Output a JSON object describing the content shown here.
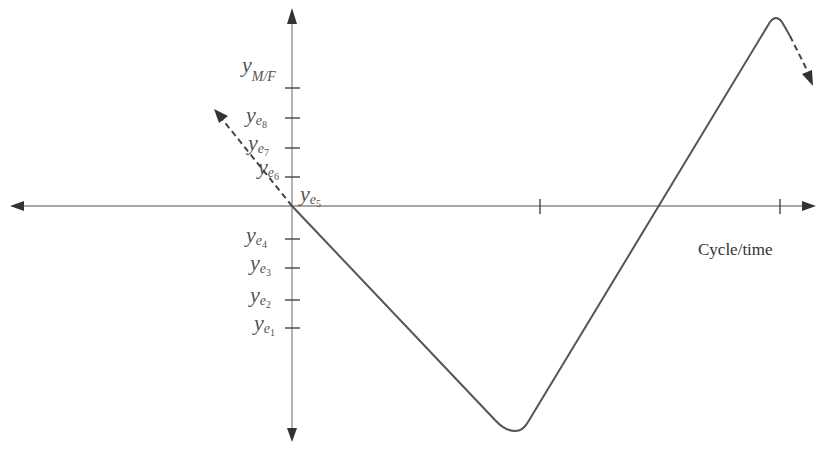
{
  "diagram": {
    "x_axis_label": "Cycle/time",
    "y_labels": {
      "mf": {
        "base": "y",
        "sub": "M/F"
      },
      "e8": {
        "base": "y",
        "sub": "e",
        "subsub": "8"
      },
      "e7": {
        "base": "y",
        "sub": "e",
        "subsub": "7"
      },
      "e6": {
        "base": "y",
        "sub": "e",
        "subsub": "6"
      },
      "e5": {
        "base": "y",
        "sub": "e",
        "subsub": "5"
      },
      "e4": {
        "base": "y",
        "sub": "e",
        "subsub": "4"
      },
      "e3": {
        "base": "y",
        "sub": "e",
        "subsub": "3"
      },
      "e2": {
        "base": "y",
        "sub": "e",
        "subsub": "2"
      },
      "e1": {
        "base": "y",
        "sub": "e",
        "subsub": "1"
      }
    },
    "colors": {
      "axis": "#8a8a8a",
      "curve": "#555555",
      "text": "#555555"
    }
  }
}
